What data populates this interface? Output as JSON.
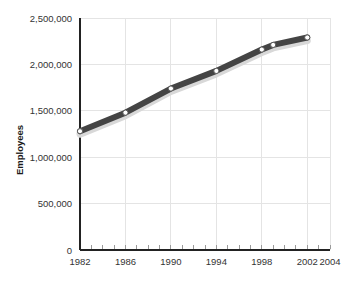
{
  "chart_data": {
    "type": "line",
    "title": "",
    "subtitle": "",
    "xlabel": "",
    "ylabel": "Employees",
    "xlim": [
      1982,
      2004
    ],
    "ylim": [
      0,
      2500000
    ],
    "grid": true,
    "legend": false,
    "x_ticks": [
      "1982",
      "1986",
      "1990",
      "1994",
      "1998",
      "2002",
      "2004"
    ],
    "x_tick_values": [
      1982,
      1986,
      1990,
      1994,
      1998,
      2002,
      2004
    ],
    "y_ticks": [
      "0",
      "500,000",
      "1,000,000",
      "1,500,000",
      "2,000,000",
      "2,500,000"
    ],
    "y_tick_values": [
      0,
      500000,
      1000000,
      1500000,
      2000000,
      2500000
    ],
    "x": [
      1982,
      1986,
      1990,
      1994,
      1998,
      1999,
      2002
    ],
    "values": [
      1280000,
      1480000,
      1740000,
      1930000,
      2160000,
      2210000,
      2290000
    ],
    "marker_labels": [
      "1982: 1,280,000",
      "1986: 1,480,000",
      "1990: 1,740,000",
      "1994: 1,930,000",
      "1998: 2,160,000",
      "1999: 2,210,000",
      "2002: 2,290,000"
    ],
    "series_color": "#444444",
    "marker_fill": "#ffffff",
    "grid_color": "#e4e4e4",
    "axis_color": "#222222"
  }
}
